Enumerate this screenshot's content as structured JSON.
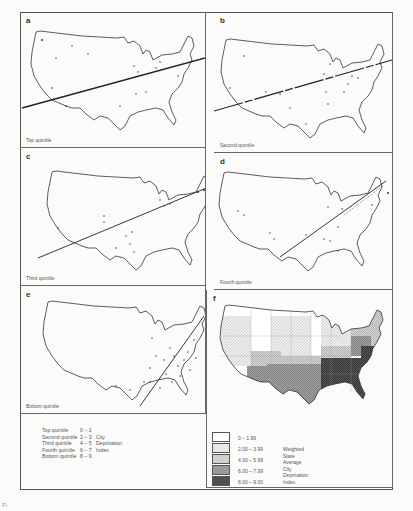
{
  "figure": {
    "panels": [
      {
        "id": "a",
        "letter": "a",
        "caption": "Top quintile"
      },
      {
        "id": "b",
        "letter": "b",
        "caption": "Second quintile"
      },
      {
        "id": "c",
        "letter": "c",
        "caption": "Third quintile"
      },
      {
        "id": "d",
        "letter": "d",
        "caption": "Fourth quintile"
      },
      {
        "id": "e",
        "letter": "e",
        "caption": "Bottom quintile"
      },
      {
        "id": "f",
        "letter": "f",
        "caption": ""
      }
    ],
    "quintile_legend": {
      "rows": [
        {
          "quintile": "Top quintile",
          "range": "0 – 1",
          "label": ""
        },
        {
          "quintile": "Second quintile",
          "range": "2 – 3",
          "label": "City"
        },
        {
          "quintile": "Third quintile",
          "range": "4 – 5",
          "label": "Deprivation"
        },
        {
          "quintile": "Fourth quintile",
          "range": "6 – 7",
          "label": "Index"
        },
        {
          "quintile": "Bottom quintile",
          "range": "8 – 9",
          "label": ""
        }
      ]
    },
    "state_legend": {
      "classes": [
        {
          "range": "0     – 1.99",
          "color": "#ffffff"
        },
        {
          "range": "2.00 – 3.99",
          "color": "#e4e4e2"
        },
        {
          "range": "4.00 – 5.99",
          "color": "#c9c9c6"
        },
        {
          "range": "6.00 – 7.99",
          "color": "#939391"
        },
        {
          "range": "8.00 – 9.00",
          "color": "#4a4a4a"
        }
      ],
      "title_lines": [
        "Weighted",
        "State",
        "Average City",
        "Deprivation",
        "Index"
      ]
    },
    "footer_mark": "Fi"
  }
}
